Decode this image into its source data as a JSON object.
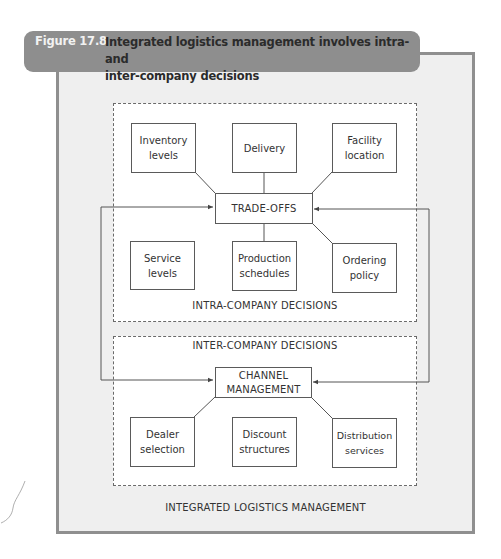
{
  "figure": {
    "label": "Figure 17.8",
    "title": "Integrated logistics management involves intra- and inter-company decisions",
    "title_line1": "Integrated logistics management involves intra- and",
    "title_line2": "inter-company decisions"
  },
  "colors": {
    "banner": "#8e8e8e",
    "frame": "#8f8f8f",
    "frame_fill": "#efefef",
    "box_border": "#5a5a5a"
  },
  "outer": {
    "label": "INTEGRATED LOGISTICS MANAGEMENT"
  },
  "intra": {
    "label": "INTRA-COMPANY DECISIONS",
    "hub": "TRADE-OFFS",
    "top_boxes": [
      {
        "line1": "Inventory",
        "line2": "levels",
        "connected": true
      },
      {
        "line1": "Delivery",
        "line2": "",
        "connected": true
      },
      {
        "line1": "Facility",
        "line2": "location",
        "connected": true
      }
    ],
    "bottom_boxes": [
      {
        "line1": "Service",
        "line2": "levels",
        "connected": false
      },
      {
        "line1": "Production",
        "line2": "schedules",
        "connected": true
      },
      {
        "line1": "Ordering",
        "line2": "policy",
        "connected": true
      }
    ]
  },
  "inter": {
    "label": "INTER-COMPANY DECISIONS",
    "hub_line1": "CHANNEL",
    "hub_line2": "MANAGEMENT",
    "boxes": [
      {
        "line1": "Dealer",
        "line2": "selection",
        "connected": true
      },
      {
        "line1": "Discount",
        "line2": "structures",
        "connected": false
      },
      {
        "line1": "Distribution",
        "line2": "services",
        "connected": true
      }
    ]
  },
  "connectors": {
    "description": "Two-way arrows link TRADE-OFFS and CHANNEL MANAGEMENT via left and right loops"
  }
}
